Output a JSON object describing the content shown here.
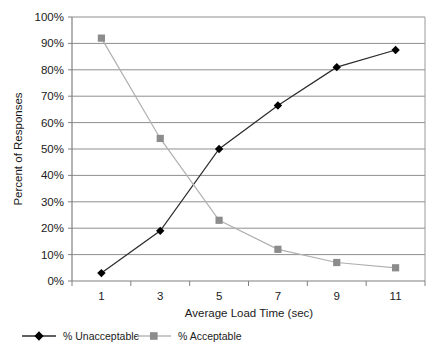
{
  "chart_data": {
    "type": "line",
    "title": "",
    "xlabel": "Average Load Time (sec)",
    "ylabel": "Percent of Responses",
    "x": [
      1,
      3,
      5,
      7,
      9,
      11
    ],
    "xlim": [
      0,
      12
    ],
    "ylim": [
      0,
      100
    ],
    "xtick_labels": [
      "1",
      "3",
      "5",
      "7",
      "9",
      "11"
    ],
    "ytick_labels": [
      "0%",
      "10%",
      "20%",
      "30%",
      "40%",
      "50%",
      "60%",
      "70%",
      "80%",
      "90%",
      "100%"
    ],
    "ytick_values": [
      0,
      10,
      20,
      30,
      40,
      50,
      60,
      70,
      80,
      90,
      100
    ],
    "grid": "horizontal",
    "legend_position": "bottom",
    "series": [
      {
        "name": "% Unacceptable",
        "values": [
          3,
          19,
          50,
          66.5,
          81,
          87.5
        ],
        "color": "#2b2b2b",
        "marker": "diamond",
        "marker_color": "#000000"
      },
      {
        "name": "% Acceptable",
        "values": [
          92,
          54,
          23,
          12,
          7,
          5
        ],
        "color": "#b0b0b0",
        "marker": "square",
        "marker_color": "#8c8c8c"
      }
    ]
  },
  "axes": {
    "frame_color": "#808080",
    "grid_color": "#8f8f8f"
  },
  "legend": {
    "items": [
      {
        "label": "% Unacceptable"
      },
      {
        "label": "% Acceptable"
      }
    ]
  }
}
